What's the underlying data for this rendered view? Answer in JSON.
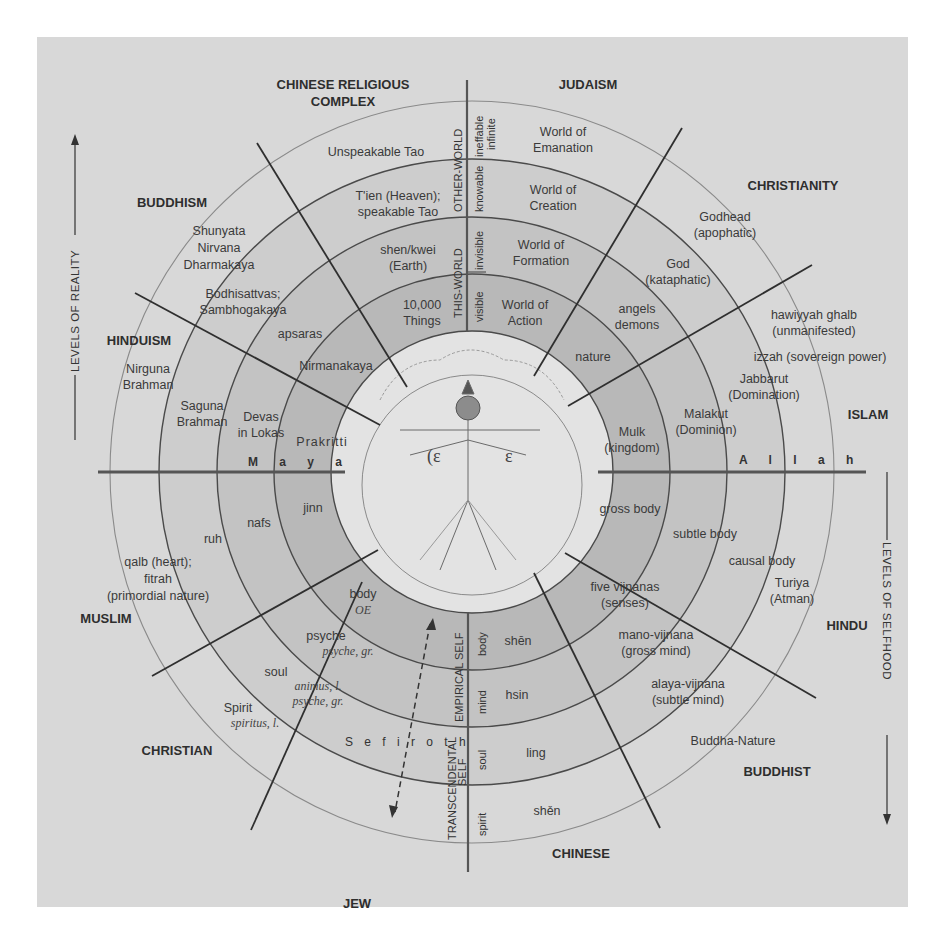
{
  "diagram": {
    "axes": {
      "left_arrow_label": "LEVELS OF REALITY",
      "right_arrow_label": "LEVELS OF SELFHOOD",
      "horizontal_left": "M a y a",
      "horizontal_right": "A l l a h",
      "vertical_bottom_band": "S e f i r o t h"
    },
    "traditions_reality": {
      "chinese": "CHINESE RELIGIOUS",
      "chinese_line2": "COMPLEX",
      "judaism": "JUDAISM",
      "christianity": "CHRISTIANITY",
      "buddhism": "BUDDHISM",
      "hinduism": "HINDUISM",
      "islam": "ISLAM"
    },
    "traditions_self": {
      "muslim": "MUSLIM",
      "christian": "CHRISTIAN",
      "jew": "JEW",
      "chinese": "CHINESE",
      "buddhist": "BUDDHIST",
      "hindu": "HINDU"
    },
    "vertical_axis_labels": {
      "other_world": "OTHER-WORLD",
      "this_world": "THIS-WORLD",
      "ineffable": "ineffable",
      "infinite": "infinite",
      "knowable": "knowable",
      "invisible": "invisible",
      "visible": "visible",
      "empirical_self": "EMPIRICAL SELF",
      "transcendental_self": "TRANSCENDENTAL",
      "transcendental_self2": "SELF",
      "body": "body",
      "mind": "mind",
      "soul": "soul",
      "spirit": "spirit"
    },
    "chinese_reality": [
      "Unspeakable Tao",
      "T'ien (Heaven);",
      "speakable Tao",
      "shen/kwei",
      "(Earth)",
      "10,000",
      "Things"
    ],
    "judaism_reality": [
      "World of",
      "Emanation",
      "World of",
      "Creation",
      "World of",
      "Formation",
      "World of",
      "Action"
    ],
    "christianity_reality": [
      "Godhead",
      "(apophatic)",
      "God",
      "(kataphatic)",
      "angels",
      "demons",
      "nature"
    ],
    "islam_reality": [
      "hawiyyah ghalb",
      "(unmanifested)",
      "izzah (sovereign power)",
      "Jabbarut",
      "(Domination)",
      "Malakut",
      "(Dominion)",
      "Mulk",
      "(kingdom)"
    ],
    "buddhism_reality": [
      "Shunyata",
      "Nirvana",
      "Dharmakaya",
      "Bodhisattvas;",
      "Sambhogakaya",
      "apsaras",
      "Nirmanakaya"
    ],
    "hinduism_reality": [
      "Nirguna",
      "Brahman",
      "Saguna",
      "Brahman",
      "Devas",
      "in Lokas",
      "Prakritti"
    ],
    "muslim_self": [
      "jinn",
      "nafs",
      "ruh",
      "qalb (heart);",
      "fitrah",
      "(primordial nature)"
    ],
    "christian_self": [
      "body",
      "OE",
      "psyche",
      "psyche, gr.",
      "soul",
      "animus, l.",
      "psyche, gr.",
      "Spirit",
      "spiritus, l."
    ],
    "chinese_self": [
      "shēn",
      "hsin",
      "ling",
      "shěn"
    ],
    "buddhist_self": [
      "five vijnanas",
      "(senses)",
      "mano-vijnana",
      "(gross mind)",
      "alaya-vijnana",
      "(subtle mind)",
      "Buddha-Nature"
    ],
    "hindu_self": [
      "gross body",
      "subtle body",
      "causal body",
      "Turiya",
      "(Atman)"
    ],
    "colors": {
      "panel": "#d8d8d8",
      "band_inner": "#b9b9b9",
      "band_mid": "#c6c6c6",
      "band_outer": "#cfcfcf",
      "center": "#e4e4e4",
      "text": "#3a3a3a"
    }
  }
}
